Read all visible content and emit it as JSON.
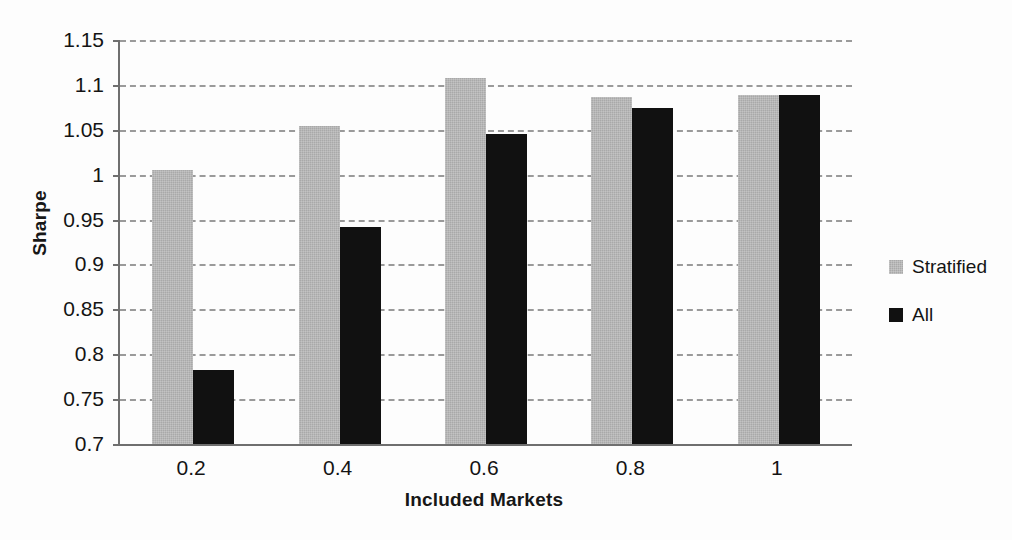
{
  "chart_data": {
    "type": "bar",
    "title": "",
    "xlabel": "Included Markets",
    "ylabel": "Sharpe",
    "categories": [
      "0.2",
      "0.4",
      "0.6",
      "0.8",
      "1"
    ],
    "series": [
      {
        "name": "Stratified",
        "color": "#a9a9a9",
        "values": [
          1.005,
          1.054,
          1.108,
          1.086,
          1.089
        ]
      },
      {
        "name": "All",
        "color": "#111111",
        "values": [
          0.782,
          0.942,
          1.045,
          1.074,
          1.089
        ]
      }
    ],
    "ylim": [
      0.7,
      1.15
    ],
    "ytick_labels": [
      "1.15",
      "1.1",
      "1.05",
      "1",
      "0.95",
      "0.9",
      "0.85",
      "0.8",
      "0.75",
      "0.7"
    ],
    "ytick_values": [
      1.15,
      1.1,
      1.05,
      1.0,
      0.95,
      0.9,
      0.85,
      0.8,
      0.75,
      0.7
    ],
    "ytick_step": 0.05,
    "grid": true,
    "grid_style": "dashed",
    "grid_axis": "y",
    "legend": [
      "Stratified",
      "All"
    ],
    "legend_position": "right"
  },
  "legend": {
    "entries": [
      {
        "label": "Stratified",
        "swatch": "legend-swatch-stratified"
      },
      {
        "label": "All",
        "swatch": "legend-swatch-all"
      }
    ]
  }
}
